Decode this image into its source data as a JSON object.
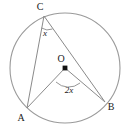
{
  "figure": {
    "colors": {
      "stroke": "#8a8a8a",
      "circle_stroke": "#9a9a9a",
      "label": "#1a1a1a",
      "center_dot": "#111111",
      "background": "#ffffff"
    },
    "circle": {
      "center_x": 65,
      "center_y": 68,
      "radius": 55
    },
    "points": [
      {
        "id": "A",
        "label": "A",
        "x": 27,
        "y": 108,
        "label_x": 21,
        "label_y": 121
      },
      {
        "id": "B",
        "label": "B",
        "x": 105,
        "y": 102,
        "label_x": 110,
        "label_y": 110
      },
      {
        "id": "C",
        "label": "C",
        "x": 44,
        "y": 16,
        "label_x": 40,
        "label_y": 10
      },
      {
        "id": "O",
        "label": "O",
        "x": 65,
        "y": 68,
        "label_x": 61,
        "label_y": 62
      }
    ],
    "segments": [
      {
        "id": "CA",
        "from": "C",
        "to": "A"
      },
      {
        "id": "CB",
        "from": "C",
        "to": "B"
      },
      {
        "id": "OA",
        "from": "O",
        "to": "A"
      },
      {
        "id": "OB",
        "from": "O",
        "to": "B"
      }
    ],
    "angles": [
      {
        "id": "inscribed-angle-at-C",
        "label": "x",
        "vertex": "C",
        "label_x": 45,
        "label_y": 35,
        "arc_path": "M 41.5 28 A 12 12 0 0 0 52.5 29"
      },
      {
        "id": "central-angle-at-O",
        "label": "2x",
        "vertex": "O",
        "label_x": 69,
        "label_y": 92,
        "arc_path": "M 56 82 A 18 18 0 0 0 80 83"
      }
    ]
  }
}
